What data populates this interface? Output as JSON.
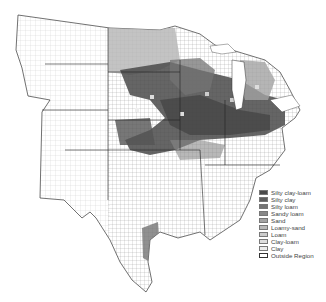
{
  "map": {
    "subject": "County-level dominant soil texture, central & eastern United States",
    "background": "#ffffff",
    "county_line_color": "#555555",
    "legend": {
      "items": [
        {
          "label": "Silty clay-loam",
          "color": "#4a4a4a"
        },
        {
          "label": "Silty clay",
          "color": "#5e5e5e"
        },
        {
          "label": "Silty loam",
          "color": "#747474"
        },
        {
          "label": "Sandy loam",
          "color": "#888888"
        },
        {
          "label": "Sand",
          "color": "#a2a2a2"
        },
        {
          "label": "Loamy-sand",
          "color": "#b8b8b8"
        },
        {
          "label": "Loam",
          "color": "#cccccc"
        },
        {
          "label": "Clay-loam",
          "color": "#dddddd"
        },
        {
          "label": "Clay",
          "color": "#ececec"
        },
        {
          "label": "Outside Region",
          "color": "#ffffff"
        }
      ]
    }
  }
}
